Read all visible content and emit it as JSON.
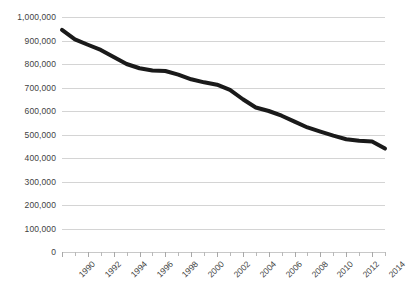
{
  "chart_data": {
    "type": "line",
    "title": "",
    "subtitle": "",
    "xlabel": "",
    "ylabel": "",
    "x": [
      1990,
      1991,
      1992,
      1993,
      1994,
      1995,
      1996,
      1997,
      1998,
      1999,
      2000,
      2001,
      2002,
      2003,
      2004,
      2005,
      2006,
      2007,
      2008,
      2009,
      2010,
      2011,
      2012,
      2013,
      2014,
      2015
    ],
    "values": [
      945000,
      905000,
      882000,
      860000,
      830000,
      800000,
      782000,
      772000,
      770000,
      755000,
      735000,
      722000,
      712000,
      690000,
      650000,
      615000,
      600000,
      580000,
      555000,
      530000,
      512000,
      495000,
      480000,
      473000,
      470000,
      440000
    ],
    "series": [
      {
        "name": "series-1",
        "color": "#1a1a1a",
        "values": [
          945000,
          905000,
          882000,
          860000,
          830000,
          800000,
          782000,
          772000,
          770000,
          755000,
          735000,
          722000,
          712000,
          690000,
          650000,
          615000,
          600000,
          580000,
          555000,
          530000,
          512000,
          495000,
          480000,
          473000,
          470000,
          440000
        ]
      }
    ],
    "ylim": [
      0,
      1000000
    ],
    "xlim": [
      1990,
      2015
    ],
    "ytick_values": [
      1000000,
      900000,
      800000,
      700000,
      600000,
      500000,
      400000,
      300000,
      200000,
      100000,
      0
    ],
    "ytick_labels": [
      "1,000,000",
      "900,000",
      "800,000",
      "700,000",
      "600,000",
      "500,000",
      "400,000",
      "300,000",
      "200,000",
      "100,000",
      "0"
    ],
    "xtick_values": [
      1990,
      1992,
      1994,
      1996,
      1998,
      2000,
      2002,
      2004,
      2006,
      2008,
      2010,
      2012,
      2014
    ],
    "xtick_labels": [
      "1990",
      "1992",
      "1994",
      "1996",
      "1998",
      "2000",
      "2002",
      "2004",
      "2006",
      "2008",
      "2010",
      "2012",
      "2014"
    ],
    "xtick_minor_values": [
      1991,
      1993,
      1995,
      1997,
      1999,
      2001,
      2003,
      2005,
      2007,
      2009,
      2011,
      2013,
      2015
    ],
    "grid": {
      "horizontal": true,
      "vertical": false,
      "color": "#d4d4d4"
    },
    "legend": {
      "visible": false,
      "position": "none",
      "entries": []
    },
    "line_style": {
      "color": "#1a1a1a",
      "width": 4,
      "markers": false
    },
    "background_color": "#ffffff",
    "text_color": "#3f3f3f"
  }
}
